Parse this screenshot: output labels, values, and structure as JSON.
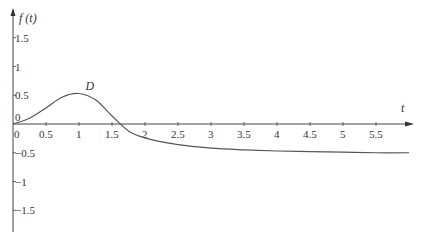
{
  "chart_data": {
    "type": "line",
    "title": "",
    "xlabel": "t",
    "ylabel": "f (t)",
    "xlim": [
      0,
      6
    ],
    "ylim": [
      -2,
      2
    ],
    "grid": false,
    "legend": null,
    "x_ticks": [
      "0",
      "0.5",
      "1",
      "1.5",
      "2",
      "2.5",
      "3",
      "3.5",
      "4",
      "4.5",
      "5",
      "5.5"
    ],
    "y_ticks": [
      "1.5",
      "1",
      "0.5",
      "0",
      "-0.5",
      "-1",
      "-1.5"
    ],
    "annotations": [
      {
        "text": "D",
        "x": 1.1,
        "y": 0.6
      }
    ],
    "series": [
      {
        "name": "f(t)",
        "color": "#555555",
        "x": [
          0,
          0.25,
          0.5,
          0.75,
          1.0,
          1.25,
          1.5,
          1.75,
          2.0,
          2.5,
          3.0,
          3.5,
          4.0,
          4.5,
          5.0,
          5.5,
          6.0
        ],
        "y": [
          0,
          0.1,
          0.28,
          0.47,
          0.53,
          0.42,
          0.14,
          -0.12,
          -0.24,
          -0.36,
          -0.42,
          -0.45,
          -0.47,
          -0.48,
          -0.49,
          -0.5,
          -0.5
        ]
      }
    ]
  }
}
